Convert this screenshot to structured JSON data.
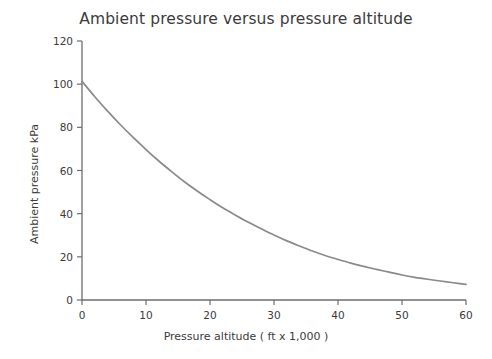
{
  "chart_data": {
    "type": "line",
    "title": "Ambient pressure versus pressure altitude",
    "xlabel": "Pressure altitude ( ft x 1,000 )",
    "ylabel": "Ambient pressure kPa",
    "xlim": [
      0,
      60
    ],
    "ylim": [
      0,
      120
    ],
    "xticks": [
      0,
      10,
      20,
      30,
      40,
      50,
      60
    ],
    "yticks": [
      0,
      20,
      40,
      60,
      80,
      100,
      120
    ],
    "xtick_labels": [
      "0",
      "10",
      "20",
      "30",
      "40",
      "50",
      "60"
    ],
    "ytick_labels": [
      "0",
      "20",
      "40",
      "60",
      "80",
      "100",
      "120"
    ],
    "grid": false,
    "legend": null,
    "line_color": "#8a8a8a",
    "axis_color": "#6d6d6d",
    "text_color": "#3b3b3b",
    "series": [
      {
        "name": "Ambient pressure",
        "x": [
          0,
          2,
          4,
          6,
          8,
          10,
          12,
          14,
          16,
          18,
          20,
          22,
          24,
          26,
          28,
          30,
          32,
          34,
          36,
          38,
          40,
          42,
          44,
          46,
          48,
          50,
          52,
          54,
          56,
          58,
          60
        ],
        "y": [
          101.3,
          94.2,
          87.5,
          81.2,
          75.3,
          69.7,
          64.4,
          59.5,
          54.8,
          50.5,
          46.5,
          42.7,
          39.3,
          36.0,
          33.0,
          30.1,
          27.4,
          25.0,
          22.7,
          20.6,
          18.8,
          17.1,
          15.6,
          14.2,
          12.9,
          11.6,
          10.5,
          9.6,
          8.8,
          8.0,
          7.2
        ]
      }
    ]
  },
  "plot_geometry": {
    "left": 82,
    "right": 466,
    "top": 41,
    "bottom": 300,
    "tick_length": 5
  }
}
